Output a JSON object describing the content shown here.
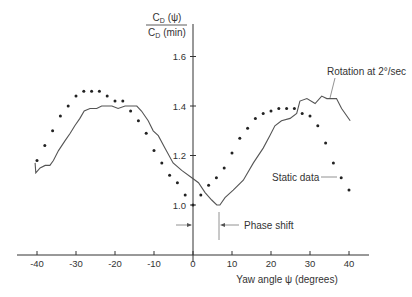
{
  "chart_data": {
    "type": "scatter",
    "title": "",
    "ylabel": {
      "numerator": "C_D (ψ)",
      "denominator": "C_D (min)",
      "num_main": "C",
      "num_sub": "D",
      "num_rest": " (ψ)",
      "den_main": "C",
      "den_sub": "D",
      "den_rest": " (min)"
    },
    "xlabel": "Yaw angle ψ (degrees)",
    "xlim": [
      -43,
      44
    ],
    "ylim": [
      0.8,
      1.7
    ],
    "x_ticks": [
      -40,
      -30,
      -20,
      -10,
      0,
      10,
      20,
      30,
      40
    ],
    "x_tick_labels": [
      "-40",
      "-30",
      "-20",
      "-10",
      "0",
      "10",
      "20",
      "30",
      "40"
    ],
    "y_ticks": [
      1.0,
      1.2,
      1.4,
      1.6
    ],
    "y_tick_labels": [
      "1.0",
      "1.2",
      "1.4",
      "1.6"
    ],
    "grid": false,
    "legend": "none (inline annotations)",
    "series": [
      {
        "name": "Static data",
        "style": "dots",
        "x": [
          -40,
          -38,
          -36,
          -34,
          -32,
          -30,
          -28,
          -26,
          -24,
          -22,
          -20,
          -18,
          -16,
          -14,
          -12,
          -10,
          -8,
          -6,
          -4,
          -2,
          0,
          2,
          4,
          6,
          8,
          10,
          12,
          14,
          16,
          18,
          20,
          22,
          24,
          26,
          28,
          30,
          32,
          34,
          36,
          38,
          40
        ],
        "values": [
          1.18,
          1.24,
          1.3,
          1.36,
          1.4,
          1.44,
          1.46,
          1.46,
          1.46,
          1.44,
          1.42,
          1.42,
          1.38,
          1.34,
          1.29,
          1.22,
          1.17,
          1.12,
          1.09,
          1.04,
          1.0,
          1.04,
          1.08,
          1.11,
          1.15,
          1.21,
          1.27,
          1.31,
          1.35,
          1.37,
          1.38,
          1.39,
          1.39,
          1.39,
          1.37,
          1.36,
          1.32,
          1.25,
          1.17,
          1.11,
          1.06
        ]
      },
      {
        "name": "Rotation at 2°/sec",
        "style": "line",
        "x": [
          -40.5,
          -40.3,
          -39.2,
          -37.9,
          -36.7,
          -35.8,
          -34.5,
          -32.8,
          -31.5,
          -30.3,
          -29.0,
          -27.9,
          -26.4,
          -24.7,
          -23.4,
          -22.1,
          -20.8,
          -19.2,
          -17.4,
          -14.4,
          -13.2,
          -11.5,
          -10.2,
          -8.9,
          -7.2,
          -5.1,
          -2.9,
          -0.3,
          1.4,
          3.1,
          4.8,
          6.1,
          6.9,
          8.2,
          10.3,
          12.9,
          15.5,
          18.0,
          19.7,
          21.0,
          22.7,
          24.9,
          26.6,
          27.4,
          29.2,
          31.3,
          33.0,
          34.3,
          36.8,
          38.1,
          40.3
        ],
        "values": [
          1.17,
          1.13,
          1.15,
          1.16,
          1.16,
          1.18,
          1.22,
          1.26,
          1.29,
          1.32,
          1.35,
          1.38,
          1.39,
          1.39,
          1.4,
          1.4,
          1.4,
          1.39,
          1.4,
          1.4,
          1.38,
          1.34,
          1.3,
          1.28,
          1.23,
          1.17,
          1.14,
          1.11,
          1.09,
          1.05,
          1.02,
          1.0,
          1.0,
          1.03,
          1.06,
          1.1,
          1.17,
          1.23,
          1.28,
          1.32,
          1.34,
          1.35,
          1.37,
          1.42,
          1.43,
          1.41,
          1.44,
          1.43,
          1.43,
          1.39,
          1.34
        ]
      }
    ],
    "annotations": [
      {
        "text": "Rotation at 2°/sec",
        "points_to": "Rotation at 2°/sec curve near ψ≈35°"
      },
      {
        "text": "Static data",
        "points_to": "static dot at ψ=38°"
      },
      {
        "text": "Phase shift",
        "between_x": [
          0,
          7
        ]
      }
    ]
  },
  "labels": {
    "rotation": "Rotation at 2°/sec",
    "static": "Static data",
    "phase": "Phase shift"
  }
}
